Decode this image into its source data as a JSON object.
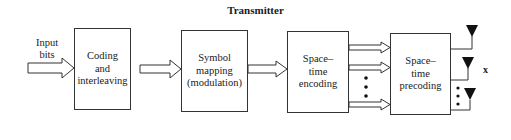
{
  "diagram": {
    "title": "Transmitter",
    "input_label": {
      "line1": "Input",
      "line2": "bits"
    },
    "blocks": [
      {
        "id": "coding",
        "lines": [
          "Coding",
          "and",
          "interleaving"
        ]
      },
      {
        "id": "symbol-mapping",
        "lines": [
          "Symbol",
          "mapping",
          "(modulation)"
        ]
      },
      {
        "id": "st-encoding",
        "lines": [
          "Space–",
          "time",
          "encoding"
        ]
      },
      {
        "id": "st-precoding",
        "lines": [
          "Space–",
          "time",
          "precoding"
        ]
      }
    ],
    "output_label": "x",
    "antenna_count_shown": 3,
    "colors": {
      "line": "#333333",
      "background": "#ffffff",
      "antenna": "#111111"
    }
  }
}
